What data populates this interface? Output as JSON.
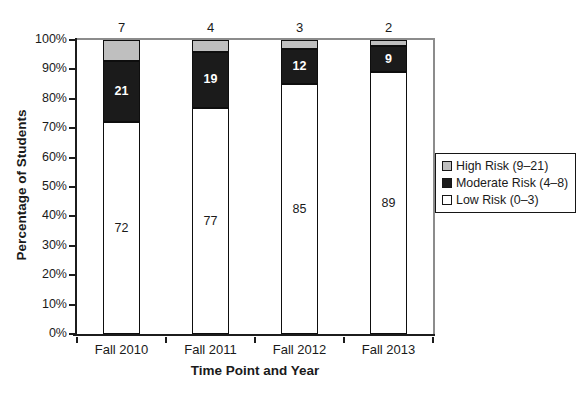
{
  "chart_data": {
    "type": "bar",
    "variant": "stacked-column",
    "categories": [
      "Fall 2010",
      "Fall 2011",
      "Fall 2012",
      "Fall 2013"
    ],
    "series": [
      {
        "name": "Low Risk (0–3)",
        "color": "#ffffff",
        "text_color": "#1a1a1a",
        "label_position": "inside",
        "label_weight": "normal",
        "values": [
          72,
          77,
          85,
          89
        ]
      },
      {
        "name": "Moderate Risk (4–8)",
        "color": "#1b1b1b",
        "text_color": "#ffffff",
        "label_position": "inside",
        "label_weight": "bold",
        "values": [
          21,
          19,
          12,
          9
        ]
      },
      {
        "name": "High Risk (9–21)",
        "color": "#bfbfbf",
        "text_color": "#1a1a1a",
        "label_position": "above",
        "label_weight": "normal",
        "values": [
          7,
          4,
          3,
          2
        ]
      }
    ],
    "xlabel": "Time Point and Year",
    "ylabel": "Percentage of Students",
    "ylim": [
      0,
      100
    ],
    "yticks": [
      "0%",
      "10%",
      "20%",
      "30%",
      "40%",
      "50%",
      "60%",
      "70%",
      "80%",
      "90%",
      "100%"
    ],
    "grid": "off",
    "legend": {
      "position": "right",
      "entries": [
        {
          "label": "High Risk (9–21)",
          "swatch": "#bfbfbf"
        },
        {
          "label": "Moderate Risk (4–8)",
          "swatch": "#1b1b1b"
        },
        {
          "label": "Low Risk (0–3)",
          "swatch": "#ffffff"
        }
      ]
    }
  }
}
